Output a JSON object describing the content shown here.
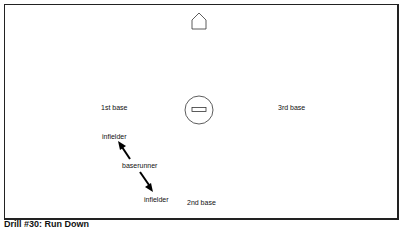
{
  "diagram": {
    "labels": {
      "first_base": "1st base",
      "second_base": "2nd base",
      "third_base": "3rd base",
      "infielder_top": "infielder",
      "infielder_bottom": "infielder",
      "baserunner": "baserunner"
    },
    "icons": {
      "home_plate": "home-plate-pentagon",
      "pitchers_mound": "circle-with-rubber"
    },
    "colors": {
      "stroke": "#222222",
      "background": "#ffffff",
      "text": "#111111"
    }
  },
  "caption": "Drill #30: Run Down"
}
